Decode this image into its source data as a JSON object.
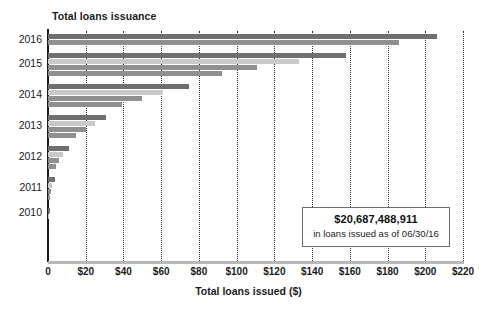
{
  "chart_data": {
    "type": "bar",
    "orientation": "horizontal",
    "title": "Total loans issuance",
    "xlabel": "Total loans issued ($)",
    "ylabel": "",
    "xlim": [
      0,
      220
    ],
    "grid": true,
    "legend": false,
    "x_tick_labels": [
      "0",
      "$20",
      "$40",
      "$60",
      "$80",
      "$100",
      "$120",
      "$140",
      "$160",
      "$180",
      "$200",
      "$220"
    ],
    "x_ticks": [
      0,
      20,
      40,
      60,
      80,
      100,
      120,
      140,
      160,
      180,
      200,
      220
    ],
    "categories": [
      "2016",
      "2015",
      "2014",
      "2013",
      "2012",
      "2011",
      "2010"
    ],
    "groups": [
      {
        "year": "2016",
        "bars": [
          {
            "value": 206,
            "shade": "dark"
          },
          {
            "value": 186,
            "shade": "mid"
          }
        ]
      },
      {
        "year": "2015",
        "bars": [
          {
            "value": 158,
            "shade": "dark"
          },
          {
            "value": 133,
            "shade": "light"
          },
          {
            "value": 111,
            "shade": "mid"
          },
          {
            "value": 92,
            "shade": "mid"
          }
        ]
      },
      {
        "year": "2014",
        "bars": [
          {
            "value": 75,
            "shade": "dark"
          },
          {
            "value": 61,
            "shade": "light"
          },
          {
            "value": 50,
            "shade": "mid"
          },
          {
            "value": 39,
            "shade": "mid"
          }
        ]
      },
      {
        "year": "2013",
        "bars": [
          {
            "value": 31,
            "shade": "dark"
          },
          {
            "value": 25,
            "shade": "light"
          },
          {
            "value": 20,
            "shade": "mid"
          },
          {
            "value": 15,
            "shade": "mid"
          }
        ]
      },
      {
        "year": "2012",
        "bars": [
          {
            "value": 11,
            "shade": "dark"
          },
          {
            "value": 8,
            "shade": "light"
          },
          {
            "value": 6,
            "shade": "mid"
          },
          {
            "value": 4.5,
            "shade": "mid"
          }
        ]
      },
      {
        "year": "2011",
        "bars": [
          {
            "value": 3.5,
            "shade": "dark"
          },
          {
            "value": 2,
            "shade": "light"
          },
          {
            "value": 1.4,
            "shade": "mid"
          },
          {
            "value": 1,
            "shade": "mid"
          }
        ]
      },
      {
        "year": "2010",
        "bars": [
          {
            "value": 0.9,
            "shade": "dark"
          },
          {
            "value": 0.4,
            "shade": "light"
          }
        ]
      }
    ],
    "annotation": {
      "amount": "$20,687,488,911",
      "caption": "in loans issued as of 06/30/16"
    }
  },
  "colors": {
    "bar_dark": "#6f6f6f",
    "bar_mid": "#8f8f8f",
    "bar_light": "#c9c9c9",
    "axis": "#1b1b1b",
    "grid": "#2b2b2b",
    "callout_border": "#6d6d6d",
    "background": "#ffffff"
  }
}
